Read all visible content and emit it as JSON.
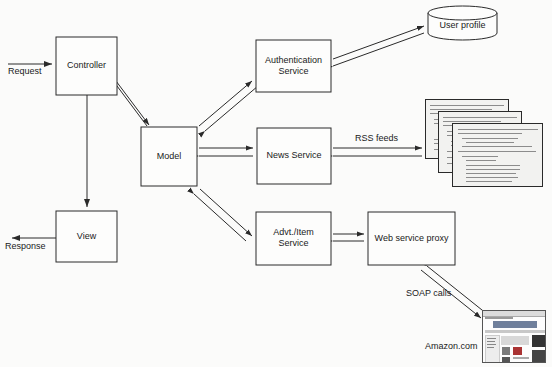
{
  "diagram": {
    "background_color": "#fbfbfa",
    "stroke_color": "#2a2a2a",
    "nodes": [
      {
        "id": "controller",
        "label": "Controller",
        "shape": "rect",
        "x": 56,
        "y": 37,
        "w": 61,
        "h": 58
      },
      {
        "id": "view",
        "label": "View",
        "shape": "rect",
        "x": 56,
        "y": 211,
        "w": 61,
        "h": 51
      },
      {
        "id": "model",
        "label": "Model",
        "shape": "rect",
        "x": 141,
        "y": 127,
        "w": 56,
        "h": 59
      },
      {
        "id": "auth",
        "label": "Authentication\nService",
        "shape": "rect",
        "x": 256,
        "y": 40,
        "w": 75,
        "h": 52
      },
      {
        "id": "news",
        "label": "News Service",
        "shape": "rect",
        "x": 257,
        "y": 128,
        "w": 74,
        "h": 56
      },
      {
        "id": "advt",
        "label": "Advt./Item\nService",
        "shape": "rect",
        "x": 256,
        "y": 212,
        "w": 75,
        "h": 53
      },
      {
        "id": "proxy",
        "label": "Web service proxy",
        "shape": "rect",
        "x": 368,
        "y": 212,
        "w": 87,
        "h": 53
      },
      {
        "id": "userprofile",
        "label": "User profile",
        "shape": "cylinder",
        "x": 428,
        "y": 6,
        "w": 69,
        "h": 34
      },
      {
        "id": "rssfeeds",
        "label": "",
        "shape": "doc-stack",
        "x": 425,
        "y": 99,
        "w": 118,
        "h": 85
      },
      {
        "id": "amazon",
        "label": "Amazon.com",
        "shape": "screenshot",
        "x": 482,
        "y": 310,
        "w": 64,
        "h": 53
      }
    ],
    "edge_labels": [
      {
        "id": "request",
        "text": "Request",
        "x": 8,
        "y": 69
      },
      {
        "id": "response",
        "text": "Response",
        "x": 5,
        "y": 243
      },
      {
        "id": "rss",
        "text": "RSS feeds",
        "x": 355,
        "y": 134
      },
      {
        "id": "soap",
        "text": "SOAP calls",
        "x": 406,
        "y": 289
      },
      {
        "id": "amazonlbl",
        "text": "Amazon.com",
        "x": 425,
        "y": 343
      }
    ],
    "edges": [
      {
        "id": "request-to-controller",
        "from": "request-origin",
        "to": "controller",
        "style": "single",
        "arrow": "end"
      },
      {
        "id": "controller-to-view",
        "from": "controller",
        "to": "view",
        "style": "single",
        "arrow": "end"
      },
      {
        "id": "view-to-response",
        "from": "view",
        "to": "response",
        "style": "single",
        "arrow": "end"
      },
      {
        "id": "controller-model",
        "from": "controller",
        "to": "model",
        "style": "double",
        "arrow": "both"
      },
      {
        "id": "model-auth",
        "from": "model",
        "to": "auth",
        "style": "double",
        "arrow": "both"
      },
      {
        "id": "model-news",
        "from": "model",
        "to": "news",
        "style": "double",
        "arrow": "both"
      },
      {
        "id": "model-advt",
        "from": "model",
        "to": "advt",
        "style": "double",
        "arrow": "both"
      },
      {
        "id": "auth-userprofile",
        "from": "auth",
        "to": "userprofile",
        "style": "double",
        "arrow": "both"
      },
      {
        "id": "news-rssfeeds",
        "from": "news",
        "to": "rssfeeds",
        "style": "double",
        "arrow": "both"
      },
      {
        "id": "advt-proxy",
        "from": "advt",
        "to": "proxy",
        "style": "double",
        "arrow": "both"
      },
      {
        "id": "proxy-amazon",
        "from": "proxy",
        "to": "amazon",
        "style": "double",
        "arrow": "both"
      }
    ]
  }
}
